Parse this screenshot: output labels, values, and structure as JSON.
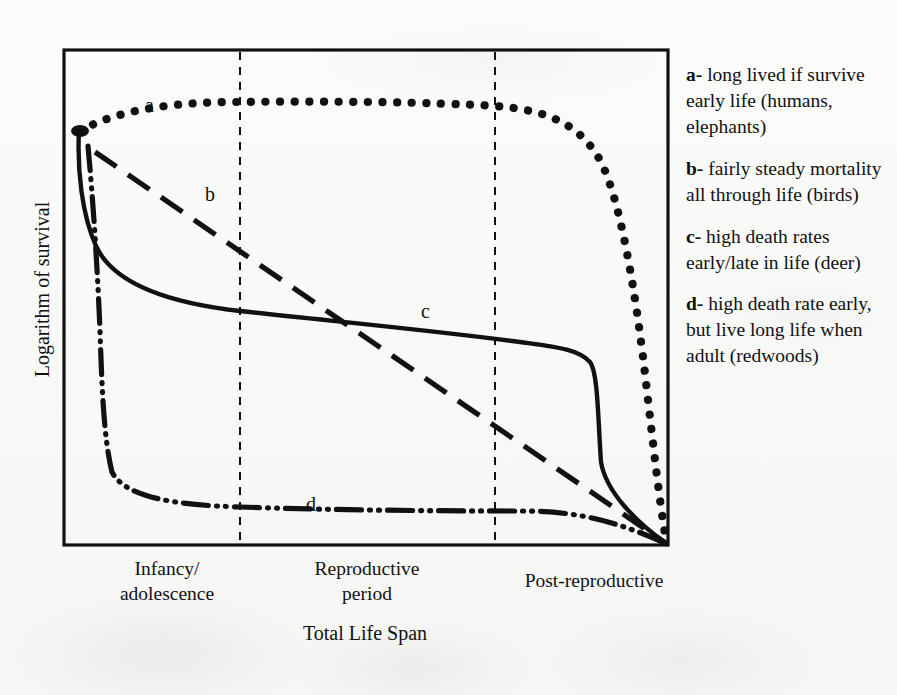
{
  "figure": {
    "y_axis_label": "Logarithm of survival",
    "x_axis_label": "Total Life Span",
    "x_segments": [
      {
        "id": "infancy",
        "label": "Infancy/\nadolescence"
      },
      {
        "id": "reproductive",
        "label": "Reproductive\nperiod"
      },
      {
        "id": "post-reproductive",
        "label": "Post-reproductive"
      }
    ],
    "curve_tags": {
      "a": "a",
      "b": "b",
      "c": "c",
      "d": "d"
    },
    "ink_color": "#111111",
    "paper_color": "#fbfbfa"
  },
  "legend": {
    "entries": [
      {
        "key": "a-",
        "text": " long lived if survive early life (humans, elephants)"
      },
      {
        "key": "b-",
        "text": " fairly steady mortality all through life (birds)"
      },
      {
        "key": "c-",
        "text": " high death rates early/late in life (deer)"
      },
      {
        "key": "d-",
        "text": " high death rate early, but live long life when adult (redwoods)"
      }
    ]
  },
  "chart_data": {
    "type": "line",
    "title": "",
    "xlabel": "Total Life Span",
    "ylabel": "Logarithm of survival",
    "xlim": [
      0,
      100
    ],
    "ylim": [
      0,
      100
    ],
    "grid": false,
    "legend_position": "right",
    "axis_ticks": false,
    "x_dividers": [
      29,
      71
    ],
    "x_divider_labels": [
      "Infancy/adolescence | Reproductive period",
      "Reproductive period | Post-reproductive"
    ],
    "series": [
      {
        "name": "a",
        "label": "a- long lived if survive early life (humans, elephants)",
        "style": "dotted",
        "x": [
          2,
          8,
          16,
          24,
          29,
          36,
          44,
          52,
          60,
          68,
          71,
          76,
          82,
          86,
          89,
          91,
          93,
          95,
          97,
          99,
          100
        ],
        "y": [
          83,
          86,
          87,
          88,
          88,
          89,
          89,
          89,
          88,
          87,
          86,
          84,
          80,
          73,
          63,
          52,
          40,
          28,
          17,
          7,
          0
        ]
      },
      {
        "name": "b",
        "label": "b- fairly steady mortality all through life (birds)",
        "style": "dashed",
        "x": [
          4,
          14,
          24,
          34,
          44,
          54,
          64,
          74,
          84,
          92,
          100
        ],
        "y": [
          80,
          72,
          64,
          56,
          48,
          40,
          32,
          24,
          16,
          9,
          0
        ]
      },
      {
        "name": "c",
        "label": "c- high death rates early/late in life (deer)",
        "style": "solid",
        "x": [
          2,
          3,
          5,
          8,
          13,
          20,
          29,
          40,
          50,
          60,
          71,
          80,
          86,
          88,
          89,
          92,
          96,
          100
        ],
        "y": [
          83,
          74,
          63,
          54,
          49,
          47,
          45,
          43,
          41,
          39,
          36,
          33,
          30,
          24,
          15,
          11,
          6,
          0
        ]
      },
      {
        "name": "d",
        "label": "d- high death rate early, but live long life when adult (redwoods)",
        "style": "dash-dot-dot",
        "x": [
          3,
          4,
          4.5,
          5,
          6,
          8,
          14,
          22,
          29,
          40,
          52,
          64,
          71,
          82,
          92,
          100
        ],
        "y": [
          79,
          62,
          45,
          30,
          20,
          13,
          10,
          9,
          8.5,
          8.5,
          9,
          9.5,
          10,
          10.5,
          10,
          0
        ]
      }
    ]
  }
}
